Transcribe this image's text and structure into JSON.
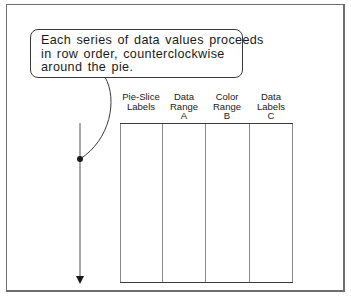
{
  "callout": {
    "lines": [
      "Each series of data values proceeds",
      "in row order, counterclockwise",
      "around the pie."
    ]
  },
  "columns": [
    {
      "lines": [
        "Pie-Slice",
        "Labels"
      ]
    },
    {
      "lines": [
        "Data",
        "Range",
        "A"
      ]
    },
    {
      "lines": [
        "Color",
        "Range",
        "B"
      ]
    },
    {
      "lines": [
        "Data",
        "Labels",
        "C"
      ]
    }
  ],
  "arrow": {
    "direction": "down",
    "meaning": "row-order"
  },
  "colors": {
    "frame": "#6e6e6e",
    "lines": "#3a3a3a",
    "table_lines": "#8a8a8a",
    "text": "#1a1a1a"
  }
}
